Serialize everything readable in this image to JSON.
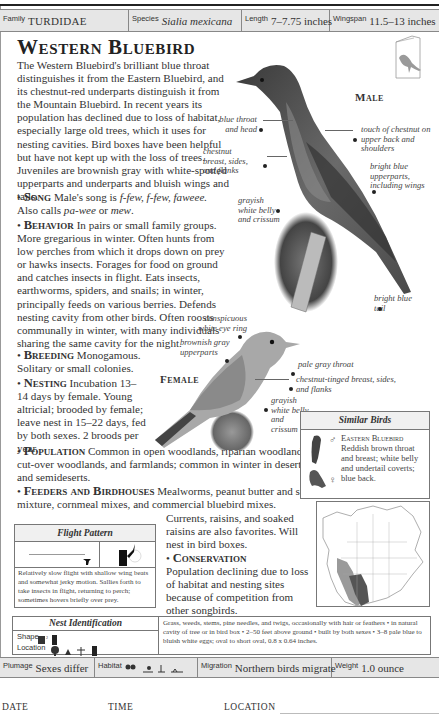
{
  "header": {
    "family": {
      "label": "Family",
      "value": "TURDIDAE"
    },
    "species": {
      "label": "Species",
      "value": "Sialia mexicana"
    },
    "length": {
      "label": "Length",
      "value": "7–7.75 inches"
    },
    "wingspan": {
      "label": "Wingspan",
      "value": "11.5–13 inches"
    }
  },
  "title": "Western Bluebird",
  "intro": "The Western Bluebird's brilliant blue throat distinguishes it from the Eastern Bluebird, and its chestnut-red underparts distinguish it from the Mountain Bluebird. In recent years its population has declined due to loss of habitat, especially large old trees, which it uses for nesting cavities. Bird boxes have been helpful but have not kept up with the loss of trees. Juveniles are brownish gray with white-spotted upperparts and underparts and bluish wings and tails.",
  "sections": {
    "song": {
      "head": "Song",
      "pre": "Male's song is ",
      "call": "f-few, f-few, faweee.",
      "mid": " Also calls ",
      "call2": "pa-wee",
      "or": " or ",
      "call3": "mew",
      "end": "."
    },
    "behavior": {
      "head": "Behavior",
      "text": "In pairs or small family groups. More gregarious in winter. Often hunts from low perches from which it drops down on prey or hawks insects. Forages for food on ground and catches insects in flight. Eats insects, earthworms, spiders, and snails; in winter, principally feeds on various berries. Defends nesting cavity from other birds. Often roosts communally in winter, with many individuals sharing the same cavity for the night."
    },
    "breeding": {
      "head": "Breeding",
      "text": "Monogamous. Solitary or small colonies."
    },
    "nesting": {
      "head": "Nesting",
      "text": "Incubation 13–14 days by female. Young altricial; brooded by female; leave nest in 15–22 days, fed by both sexes. 2 broods per year."
    },
    "population": {
      "head": "Population",
      "text": "Common in open woodlands, riparian woodlands, cut-over woodlands, and farmlands; common in winter in deserts and semideserts."
    },
    "feeders": {
      "head": "Feeders and Birdhouses",
      "text": "Mealworms, peanut butter and suet mixture, cornmeal mixes, and commercial bluebird mixes.",
      "text2": "Currents, raisins, and soaked raisins are also favorites. Will nest in bird boxes."
    },
    "conservation": {
      "head": "Conservation",
      "text": "Population declining due to loss of habitat and nesting sites because of competition from other songbirds."
    }
  },
  "male": {
    "label": "Male",
    "captions": {
      "throat": "blue throat and head",
      "chestnut": "chestnut breast, sides, and flanks",
      "belly": "grayish white belly and crissum",
      "back": "touch of chestnut on upper back and shoulders",
      "upper": "bright blue upperparts, including wings",
      "tail": "bright blue tail"
    }
  },
  "female": {
    "label": "Female",
    "captions": {
      "eye": "conspicuous white eye ring",
      "upper": "brownish gray upperparts",
      "throat": "pale gray throat",
      "breast": "chestnut-tinged breast, sides, and flanks",
      "belly": "grayish white belly and crissum"
    }
  },
  "similar_birds": {
    "title": "Similar Birds",
    "name": "Eastern Bluebird",
    "text": "Reddish brown throat and breast; white belly and undertail coverts; blue back.",
    "male_symbol": "♂",
    "female_symbol": "♀"
  },
  "flight_pattern": {
    "title": "Flight Pattern",
    "text": "Relatively slow flight with shallow wing beats and somewhat jerky motion. Sallies forth to take insects in flight, returning to perch; sometimes hovers briefly over prey."
  },
  "nest_identification": {
    "title": "Nest Identification",
    "shape_label": "Shape",
    "location_label": "Location",
    "text": "Grass, weeds, stems, pine needles, and twigs, occasionally with hair or feathers • in natural cavity of tree or in bird box • 2–50 feet above ground • built by both sexes • 3–8 pale blue to bluish white eggs; oval to short oval, 0.8 x 0.64 inches."
  },
  "footer": {
    "plumage": {
      "label": "Plumage",
      "value": "Sexes differ"
    },
    "habitat": {
      "label": "Habitat"
    },
    "migration": {
      "label": "Migration",
      "value": "Northern birds migrate"
    },
    "weight": {
      "label": "Weight",
      "value": "1.0 ounce"
    }
  },
  "log": {
    "date": "DATE",
    "time": "TIME",
    "location": "LOCATION"
  },
  "colors": {
    "bar_bg": "#e6e6e6",
    "range_dark": "#555555",
    "range_light": "#9a9a9a"
  }
}
